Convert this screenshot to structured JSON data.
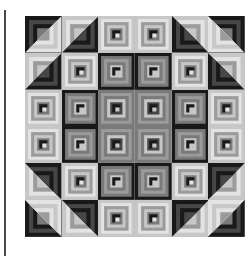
{
  "image": {
    "subject": "Log cabin quilt (grayscale photograph)",
    "grid": {
      "rows": 6,
      "cols": 6
    },
    "palette": {
      "dark": "#1e1e1e",
      "darkmid": "#4a4a4a",
      "mid": "#7a7a7a",
      "midlight": "#9a9a9a",
      "light": "#c4c4c4",
      "pale": "#dedede"
    },
    "blocks": [
      [
        "corner-tl",
        "corner-tl-light",
        "lightframe",
        "lightframe",
        "corner-tr-light",
        "corner-tr"
      ],
      [
        "corner-tl-light",
        "lightframe",
        "darkframe",
        "darkframe",
        "lightframe",
        "corner-tr-light"
      ],
      [
        "lightframe",
        "darkframe",
        "midframe",
        "midframe",
        "darkframe",
        "lightframe"
      ],
      [
        "lightframe",
        "darkframe",
        "midframe",
        "midframe",
        "darkframe",
        "lightframe"
      ],
      [
        "corner-bl-light",
        "lightframe",
        "darkframe",
        "darkframe",
        "lightframe",
        "corner-br-light"
      ],
      [
        "corner-bl",
        "corner-bl-light",
        "lightframe",
        "lightframe",
        "corner-br-light",
        "corner-br"
      ]
    ]
  }
}
